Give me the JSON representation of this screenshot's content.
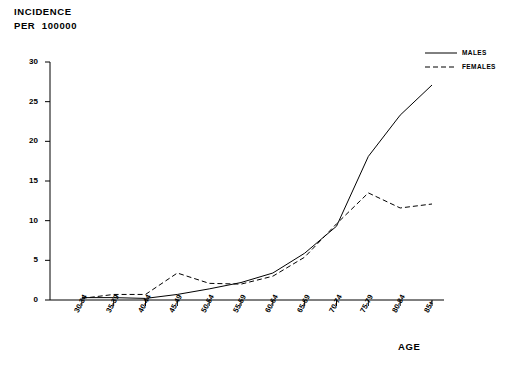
{
  "chart_data": {
    "type": "line",
    "title": "",
    "ylabel_lines": [
      "INCIDENCE",
      "PER  100000"
    ],
    "xlabel": "AGE",
    "categories": [
      "30-34",
      "35-39",
      "40-44",
      "45-49",
      "50-54",
      "55-59",
      "60-64",
      "65-69",
      "70-74",
      "75-79",
      "80-84",
      "85+"
    ],
    "ylim": [
      0,
      30
    ],
    "yticks": [
      0,
      5,
      10,
      15,
      20,
      25,
      30
    ],
    "ytick_labels": [
      "0",
      "5",
      "10",
      "15",
      "20",
      "25",
      "30"
    ],
    "grid": false,
    "legend_position": "top-right",
    "series": [
      {
        "name": "MALES",
        "style": "solid",
        "color": "#000000",
        "values": [
          0.3,
          0.3,
          0.2,
          0.7,
          1.4,
          2.2,
          3.4,
          5.9,
          9.3,
          18.1,
          23.3,
          27.1
        ]
      },
      {
        "name": "FEMALES",
        "style": "dashed",
        "color": "#000000",
        "values": [
          0.2,
          0.7,
          0.7,
          3.4,
          2.1,
          2.0,
          3.0,
          5.4,
          9.6,
          13.5,
          11.6,
          12.1
        ]
      }
    ],
    "annotations": []
  },
  "legend": {
    "items": [
      {
        "label": "MALES",
        "style": "solid"
      },
      {
        "label": "FEMALES",
        "style": "dashed"
      }
    ]
  }
}
